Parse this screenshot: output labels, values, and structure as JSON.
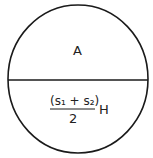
{
  "diagram": {
    "shape": "circle",
    "top_label": "A",
    "bottom_formula": {
      "numerator": "(s₁ + s₂)",
      "denominator": "2",
      "suffix": "H"
    },
    "stroke_color": "#1a1a1a"
  }
}
